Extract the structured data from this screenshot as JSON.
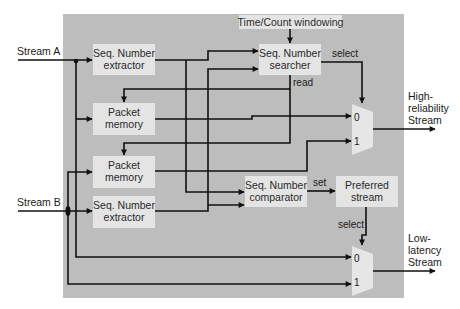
{
  "inputs": {
    "stream_a": "Stream A",
    "stream_b": "Stream B"
  },
  "blocks": {
    "time_count_windowing": "Time/Count windowing",
    "extractor_a": {
      "line1": "Seq. Number",
      "line2": "extractor"
    },
    "packet_memory_a": {
      "line1": "Packet",
      "line2": "memory"
    },
    "packet_memory_b": {
      "line1": "Packet",
      "line2": "memory"
    },
    "extractor_b": {
      "line1": "Seq. Number",
      "line2": "extractor"
    },
    "searcher": {
      "line1": "Seq. Number",
      "line2": "searcher"
    },
    "comparator": {
      "line1": "Seq. Number",
      "line2": "comparator"
    },
    "preferred_stream": {
      "line1": "Preferred",
      "line2": "stream"
    }
  },
  "signals": {
    "select_top": "select",
    "read": "read",
    "set": "set",
    "select_bottom": "select"
  },
  "muxes": {
    "high_reliability": {
      "in0": "0",
      "in1": "1"
    },
    "low_latency": {
      "in0": "0",
      "in1": "1"
    }
  },
  "outputs": {
    "high_reliability": {
      "line1": "High-",
      "line2": "reliability",
      "line3": "Stream"
    },
    "low_latency": {
      "line1": "Low-",
      "line2": "latency",
      "line3": "Stream"
    }
  },
  "colors": {
    "panel": "#bdbdbd",
    "box": "#e4e4e4",
    "wire": "#111111"
  }
}
